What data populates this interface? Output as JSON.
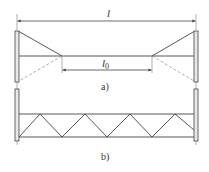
{
  "figure": {
    "part_a": {
      "caption": "a)",
      "overall_dimension_label": "l",
      "inner_dimension_label": "l",
      "inner_dimension_subscript": "0"
    },
    "part_b": {
      "caption": "b)"
    }
  },
  "colors": {
    "line": "#444444",
    "dashed": "#9a9a9a",
    "post_fill": "#e8e8e8",
    "text": "#333333"
  }
}
